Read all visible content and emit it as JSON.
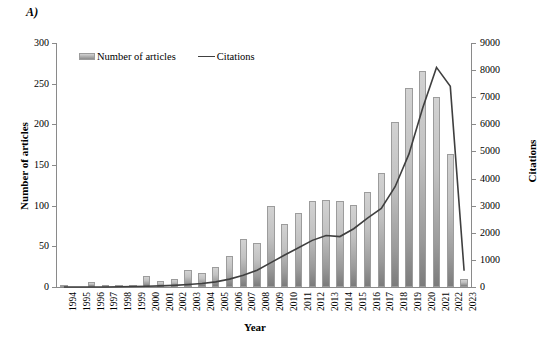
{
  "panel": {
    "label": "A)"
  },
  "legend": {
    "position": "top-left-inside",
    "items": [
      {
        "name": "Number of articles",
        "marker": "bar-swatch"
      },
      {
        "name": "Citations",
        "marker": "line-swatch"
      }
    ]
  },
  "axes": {
    "x": {
      "title": "Year"
    },
    "y_left": {
      "title": "Number of articles",
      "ticks": [
        "0",
        "50",
        "100",
        "150",
        "200",
        "250",
        "300"
      ]
    },
    "y_right": {
      "title": "Citations",
      "ticks": [
        "0",
        "1000",
        "2000",
        "3000",
        "4000",
        "5000",
        "6000",
        "7000",
        "8000",
        "9000"
      ]
    }
  },
  "colors": {
    "bar_top": "#d2d2d2",
    "bar_bottom": "#7b7b7b",
    "bar_border": "#9c9c9c",
    "line": "#3f3f3f",
    "axis": "#8a8a8a",
    "text": "#000000",
    "background": "#ffffff"
  },
  "chart_data": {
    "type": "bar",
    "title": "",
    "subtitle": "",
    "xlabel": "Year",
    "ylabel": "Number of articles",
    "y2label": "Citations",
    "grid": false,
    "legend_position": "top-left",
    "ylim": [
      0,
      300
    ],
    "y2lim": [
      0,
      9000
    ],
    "ytick_step": 50,
    "y2tick_step": 1000,
    "categories": [
      "1994",
      "1995",
      "1996",
      "1997",
      "1998",
      "1999",
      "2000",
      "2001",
      "2002",
      "2003",
      "2004",
      "2005",
      "2006",
      "2007",
      "2008",
      "2009",
      "2010",
      "2011",
      "2012",
      "2013",
      "2014",
      "2015",
      "2016",
      "2017",
      "2018",
      "2019",
      "2020",
      "2021",
      "2022",
      "2023"
    ],
    "series": [
      {
        "name": "Number of articles",
        "type": "bar",
        "axis": "left",
        "values": [
          1,
          0,
          6,
          2,
          3,
          2,
          14,
          8,
          10,
          21,
          17,
          25,
          38,
          59,
          54,
          100,
          77,
          91,
          106,
          107,
          106,
          101,
          117,
          140,
          203,
          245,
          266,
          234,
          164,
          10
        ]
      },
      {
        "name": "Citations",
        "type": "line",
        "axis": "right",
        "values": [
          0,
          0,
          0,
          0,
          10,
          20,
          30,
          40,
          60,
          90,
          130,
          190,
          290,
          430,
          620,
          900,
          1180,
          1450,
          1720,
          1900,
          1860,
          2150,
          2540,
          2900,
          3700,
          4900,
          6600,
          8100,
          7400,
          600
        ]
      }
    ]
  }
}
